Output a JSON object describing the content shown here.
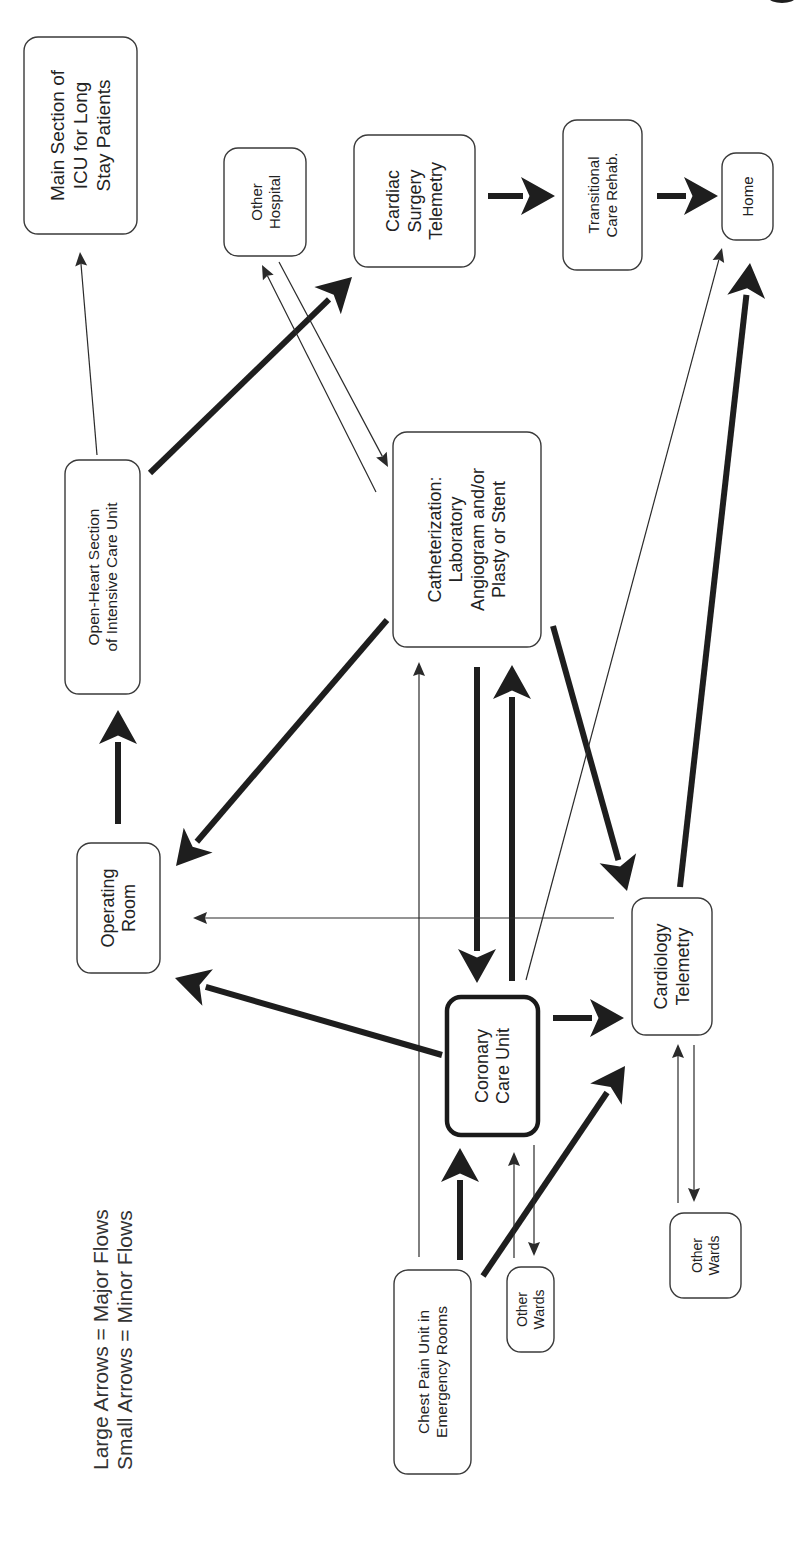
{
  "legend": {
    "major": "Large Arrows = Major Flows",
    "minor": "Small Arrows = Minor Flows"
  },
  "colors": {
    "ink": "#1e1e1e",
    "box_border": "#3a3a3a",
    "background": "#ffffff"
  },
  "nodes": [
    {
      "id": "main_icu",
      "lines": [
        "Main Section of",
        "ICU for Long",
        "Stay Patients"
      ]
    },
    {
      "id": "other_hospital",
      "lines": [
        "Other",
        "Hospital"
      ]
    },
    {
      "id": "cardiac_surgery",
      "lines": [
        "Cardiac",
        "Surgery",
        "Telemetry"
      ]
    },
    {
      "id": "transitional",
      "lines": [
        "Transitional",
        "Care Rehab."
      ]
    },
    {
      "id": "home",
      "lines": [
        "Home"
      ]
    },
    {
      "id": "open_heart",
      "lines": [
        "Open-Heart Section",
        "of Intensive Care Unit"
      ]
    },
    {
      "id": "cath_lab",
      "lines": [
        "Catheterization:",
        "Laboratory",
        "Angiogram and/or",
        "Plasty or Stent"
      ]
    },
    {
      "id": "operating_room",
      "lines": [
        "Operating",
        "Room"
      ]
    },
    {
      "id": "cardiology_telemetry",
      "lines": [
        "Cardiology",
        "Telemetry"
      ]
    },
    {
      "id": "coronary_care",
      "lines": [
        "Coronary",
        "Care Unit"
      ],
      "emphasis": true
    },
    {
      "id": "chest_pain",
      "lines": [
        "Chest Pain Unit in",
        "Emergency Rooms"
      ]
    },
    {
      "id": "other_wards_ccu",
      "lines": [
        "Other",
        "Wards"
      ]
    },
    {
      "id": "other_wards_tele",
      "lines": [
        "Other",
        "Wards"
      ]
    }
  ],
  "edges": [
    {
      "from": "open_heart",
      "to": "main_icu",
      "flow": "minor"
    },
    {
      "from": "open_heart",
      "to": "cardiac_surgery",
      "flow": "major"
    },
    {
      "from": "cath_lab",
      "to": "other_hospital",
      "flow": "minor"
    },
    {
      "from": "other_hospital",
      "to": "cath_lab",
      "flow": "minor"
    },
    {
      "from": "cardiac_surgery",
      "to": "transitional",
      "flow": "major"
    },
    {
      "from": "transitional",
      "to": "home",
      "flow": "major"
    },
    {
      "from": "operating_room",
      "to": "open_heart",
      "flow": "major"
    },
    {
      "from": "cath_lab",
      "to": "operating_room",
      "flow": "major"
    },
    {
      "from": "cath_lab",
      "to": "coronary_care",
      "flow": "major"
    },
    {
      "from": "coronary_care",
      "to": "cath_lab",
      "flow": "major"
    },
    {
      "from": "cath_lab",
      "to": "cardiology_telemetry",
      "flow": "major"
    },
    {
      "from": "chest_pain",
      "to": "cath_lab",
      "flow": "minor"
    },
    {
      "from": "coronary_care",
      "to": "home",
      "flow": "minor"
    },
    {
      "from": "cardiology_telemetry",
      "to": "home",
      "flow": "major"
    },
    {
      "from": "cardiology_telemetry",
      "to": "operating_room",
      "flow": "minor"
    },
    {
      "from": "coronary_care",
      "to": "operating_room",
      "flow": "major"
    },
    {
      "from": "coronary_care",
      "to": "cardiology_telemetry",
      "flow": "major"
    },
    {
      "from": "chest_pain",
      "to": "coronary_care",
      "flow": "major"
    },
    {
      "from": "chest_pain",
      "to": "cardiology_telemetry",
      "flow": "major"
    },
    {
      "from": "other_wards_ccu",
      "to": "coronary_care",
      "flow": "minor"
    },
    {
      "from": "coronary_care",
      "to": "other_wards_ccu",
      "flow": "minor"
    },
    {
      "from": "other_wards_tele",
      "to": "cardiology_telemetry",
      "flow": "minor"
    },
    {
      "from": "cardiology_telemetry",
      "to": "other_wards_tele",
      "flow": "minor"
    }
  ]
}
